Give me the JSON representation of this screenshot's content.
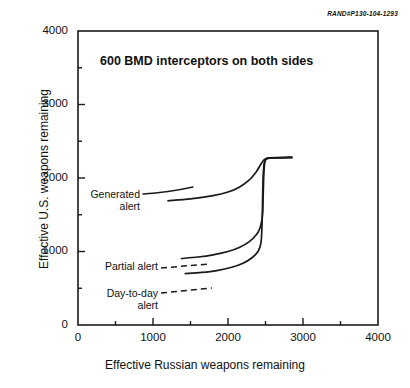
{
  "document_id": "RAND#P130-104-1293",
  "chart_data": {
    "type": "line",
    "title": "600 BMD interceptors on both sides",
    "xlabel": "Effective Russian weapons remaining",
    "ylabel": "Effective U.S. weapons remaining",
    "xlim": [
      0,
      4000
    ],
    "ylim": [
      0,
      4000
    ],
    "xticks": [
      0,
      1000,
      2000,
      3000,
      4000
    ],
    "yticks": [
      0,
      1000,
      2000,
      3000,
      4000
    ],
    "xtick_labels": [
      "0",
      "1000",
      "2000",
      "3000",
      "4000"
    ],
    "ytick_labels": [
      "0",
      "1000",
      "2000",
      "3000",
      "4000"
    ],
    "minor_tick_interval": 500,
    "grid": false,
    "legend": "inline-annotations",
    "series": [
      {
        "name": "Generated alert",
        "label": "Generated\nalert",
        "label_line1": "Generated",
        "label_line2": "alert",
        "style": "solid",
        "points": [
          [
            1200,
            1690
          ],
          [
            1500,
            1715
          ],
          [
            1800,
            1760
          ],
          [
            2000,
            1810
          ],
          [
            2150,
            1875
          ],
          [
            2280,
            1970
          ],
          [
            2380,
            2090
          ],
          [
            2440,
            2190
          ],
          [
            2490,
            2255
          ],
          [
            2560,
            2270
          ],
          [
            2700,
            2275
          ],
          [
            2850,
            2280
          ]
        ]
      },
      {
        "name": "Partial alert",
        "label": "Partial alert",
        "label_line1": "Partial alert",
        "label_line2": "",
        "style": "solid",
        "points": [
          [
            1380,
            905
          ],
          [
            1600,
            925
          ],
          [
            1800,
            955
          ],
          [
            2000,
            1000
          ],
          [
            2150,
            1055
          ],
          [
            2280,
            1130
          ],
          [
            2380,
            1230
          ],
          [
            2430,
            1330
          ],
          [
            2460,
            1500
          ],
          [
            2470,
            1800
          ],
          [
            2480,
            2100
          ],
          [
            2500,
            2250
          ],
          [
            2560,
            2275
          ],
          [
            2700,
            2278
          ],
          [
            2850,
            2280
          ]
        ]
      },
      {
        "name": "Day-to-day alert",
        "label": "Day-to-day\nalert",
        "label_line1": "Day-to-day",
        "label_line2": "alert",
        "style": "solid",
        "points": [
          [
            1430,
            700
          ],
          [
            1650,
            715
          ],
          [
            1850,
            740
          ],
          [
            2050,
            785
          ],
          [
            2200,
            840
          ],
          [
            2320,
            915
          ],
          [
            2400,
            1000
          ],
          [
            2440,
            1120
          ],
          [
            2455,
            1400
          ],
          [
            2462,
            1750
          ],
          [
            2470,
            2050
          ],
          [
            2490,
            2230
          ],
          [
            2550,
            2270
          ],
          [
            2700,
            2276
          ],
          [
            2850,
            2280
          ]
        ]
      }
    ]
  },
  "annotations": {
    "generated_alert": {
      "line1": "Generated",
      "line2": "alert"
    },
    "partial_alert": {
      "line1": "Partial alert",
      "line2": ""
    },
    "day_to_day_alert": {
      "line1": "Day-to-day",
      "line2": "alert"
    }
  },
  "axis": {
    "x_ticks": [
      {
        "value": "0"
      },
      {
        "value": "1000"
      },
      {
        "value": "2000"
      },
      {
        "value": "3000"
      },
      {
        "value": "4000"
      }
    ],
    "y_ticks": [
      {
        "value": "0"
      },
      {
        "value": "1000"
      },
      {
        "value": "2000"
      },
      {
        "value": "3000"
      },
      {
        "value": "4000"
      }
    ]
  }
}
